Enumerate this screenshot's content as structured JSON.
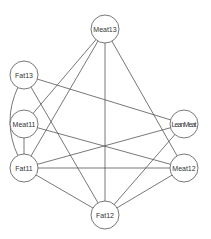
{
  "diagram": {
    "type": "undirected-graph",
    "nodes": [
      {
        "id": "Meat13",
        "label": "Meat13",
        "x": 105,
        "y": 29
      },
      {
        "id": "Fat13",
        "label": "Fat13",
        "x": 24,
        "y": 75
      },
      {
        "id": "Meat11",
        "label": "Meat11",
        "x": 24,
        "y": 124
      },
      {
        "id": "LeanMeat",
        "label": "LeanMeat",
        "x": 184,
        "y": 124
      },
      {
        "id": "Fat11",
        "label": "Fat11",
        "x": 24,
        "y": 168
      },
      {
        "id": "Meat12",
        "label": "Meat12",
        "x": 184,
        "y": 168
      },
      {
        "id": "Fat12",
        "label": "Fat12",
        "x": 105,
        "y": 215
      }
    ],
    "node_radius": 14,
    "edges": [
      {
        "from": "Meat13",
        "to": "Meat11"
      },
      {
        "from": "Meat13",
        "to": "Fat11"
      },
      {
        "from": "Meat13",
        "to": "Fat12"
      },
      {
        "from": "Meat13",
        "to": "Meat12"
      },
      {
        "from": "Fat13",
        "to": "LeanMeat"
      },
      {
        "from": "Fat13",
        "to": "Fat12"
      },
      {
        "from": "Fat13",
        "to": "Fat11",
        "curved": true
      },
      {
        "from": "Meat11",
        "to": "Meat12"
      },
      {
        "from": "Meat11",
        "to": "Fat11"
      },
      {
        "from": "Fat11",
        "to": "LeanMeat"
      },
      {
        "from": "Fat11",
        "to": "Meat12"
      },
      {
        "from": "Fat11",
        "to": "Fat12"
      },
      {
        "from": "Meat12",
        "to": "Fat12"
      },
      {
        "from": "LeanMeat",
        "to": "Fat12"
      }
    ]
  }
}
